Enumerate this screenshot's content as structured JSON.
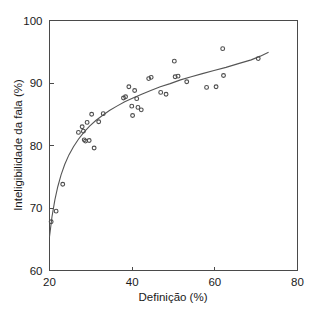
{
  "chart_data": {
    "type": "scatter",
    "title": "",
    "xlabel": "Definição (%)",
    "ylabel": "Inteligibilidade da fala (%)",
    "xlim": [
      20,
      80
    ],
    "ylim": [
      60,
      100
    ],
    "xticks": [
      20,
      40,
      60,
      80
    ],
    "yticks": [
      60,
      70,
      80,
      90,
      100
    ],
    "xtick_labels": [
      "20",
      "40",
      "60",
      "80"
    ],
    "ytick_labels": [
      "60",
      "70",
      "80",
      "90",
      "100"
    ],
    "grid": false,
    "legend": "none",
    "marker": "open-circle",
    "points": [
      [
        20.4,
        67.8
      ],
      [
        21.6,
        69.5
      ],
      [
        23.2,
        73.8
      ],
      [
        27.0,
        82.1
      ],
      [
        27.9,
        83.0
      ],
      [
        28.2,
        82.3
      ],
      [
        28.4,
        80.9
      ],
      [
        28.7,
        80.7
      ],
      [
        29.1,
        83.7
      ],
      [
        29.6,
        80.8
      ],
      [
        30.2,
        85.0
      ],
      [
        30.8,
        79.6
      ],
      [
        31.9,
        83.8
      ],
      [
        33.0,
        85.1
      ],
      [
        37.9,
        87.6
      ],
      [
        38.4,
        87.8
      ],
      [
        39.2,
        89.4
      ],
      [
        39.9,
        86.3
      ],
      [
        40.1,
        84.8
      ],
      [
        40.6,
        88.8
      ],
      [
        41.1,
        87.5
      ],
      [
        41.4,
        86.1
      ],
      [
        42.2,
        85.7
      ],
      [
        44.0,
        90.7
      ],
      [
        44.6,
        90.9
      ],
      [
        46.9,
        88.5
      ],
      [
        48.2,
        88.2
      ],
      [
        50.2,
        93.5
      ],
      [
        50.4,
        91.0
      ],
      [
        51.1,
        91.1
      ],
      [
        53.2,
        90.2
      ],
      [
        58.0,
        89.3
      ],
      [
        60.3,
        89.4
      ],
      [
        61.9,
        95.5
      ],
      [
        62.1,
        91.2
      ],
      [
        70.5,
        93.9
      ]
    ],
    "fit_curve": {
      "description": "logarithmic regression trend line",
      "x_start": 20.0,
      "x_end": 73.0,
      "y_start": 65.4,
      "y_end": 94.9,
      "points": [
        [
          20.0,
          65.4
        ],
        [
          20.6,
          68.6
        ],
        [
          21.3,
          71.3
        ],
        [
          22.0,
          73.4
        ],
        [
          22.8,
          75.3
        ],
        [
          23.7,
          77.0
        ],
        [
          24.7,
          78.5
        ],
        [
          25.8,
          79.8
        ],
        [
          27.0,
          81.0
        ],
        [
          28.3,
          82.1
        ],
        [
          29.7,
          83.1
        ],
        [
          31.2,
          84.0
        ],
        [
          32.8,
          84.8
        ],
        [
          34.5,
          85.6
        ],
        [
          36.3,
          86.3
        ],
        [
          38.2,
          87.0
        ],
        [
          40.2,
          87.6
        ],
        [
          42.3,
          88.2
        ],
        [
          44.5,
          88.8
        ],
        [
          46.8,
          89.4
        ],
        [
          49.2,
          89.9
        ],
        [
          51.7,
          90.5
        ],
        [
          54.3,
          91.0
        ],
        [
          57.0,
          91.5
        ],
        [
          59.8,
          92.0
        ],
        [
          62.7,
          92.5
        ],
        [
          65.7,
          93.1
        ],
        [
          68.8,
          93.7
        ],
        [
          71.0,
          94.3
        ],
        [
          73.0,
          94.9
        ]
      ]
    }
  }
}
